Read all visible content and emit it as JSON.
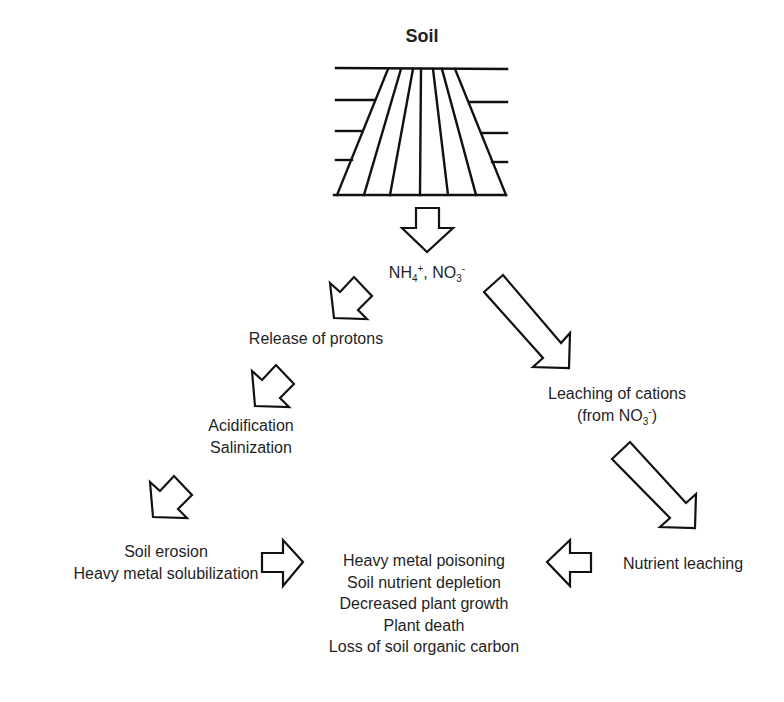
{
  "diagram": {
    "title": "Soil",
    "nodes": {
      "ions": {
        "prefix": "NH",
        "sub1": "4",
        "sup1": "+",
        "mid": ", NO",
        "sub2": "3",
        "sup2": "-"
      },
      "protons": "Release of protons",
      "acid": [
        "Acidification",
        "Salinization"
      ],
      "erosion": [
        "Soil erosion",
        "Heavy metal solubilization"
      ],
      "leaching_cations": {
        "line1": "Leaching of cations",
        "line2_prefix": "(from NO",
        "line2_sub": "3",
        "line2_sup": "-",
        "line2_suffix": ")"
      },
      "nutrient_leaching": "Nutrient leaching",
      "outcomes": [
        "Heavy metal poisoning",
        "Soil nutrient depletion",
        "Decreased plant growth",
        "Plant death",
        "Loss of soil organic carbon"
      ]
    },
    "edges": [
      {
        "from": "Soil",
        "to": "NH4+, NO3-",
        "icon": "arrow-down"
      },
      {
        "from": "NH4+, NO3-",
        "to": "Release of protons",
        "icon": "arrow-down-left"
      },
      {
        "from": "Release of protons",
        "to": "Acidification / Salinization",
        "icon": "arrow-down-left"
      },
      {
        "from": "Acidification / Salinization",
        "to": "Soil erosion / Heavy metal solubilization",
        "icon": "arrow-down-left"
      },
      {
        "from": "Soil erosion / Heavy metal solubilization",
        "to": "Outcomes",
        "icon": "arrow-right"
      },
      {
        "from": "NH4+, NO3-",
        "to": "Leaching of cations (from NO3-)",
        "icon": "arrow-down-right"
      },
      {
        "from": "Leaching of cations (from NO3-)",
        "to": "Nutrient leaching",
        "icon": "arrow-down-right"
      },
      {
        "from": "Nutrient leaching",
        "to": "Outcomes",
        "icon": "arrow-left"
      }
    ],
    "colors": {
      "stroke": "#111111",
      "fill": "#ffffff",
      "text": "#1f1f1f"
    }
  }
}
